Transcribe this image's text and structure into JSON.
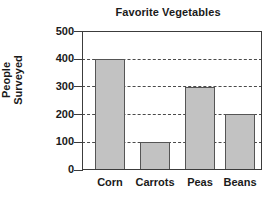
{
  "chart_data": {
    "type": "bar",
    "title": "Favorite Vegetables",
    "xlabel": "",
    "ylabel": "People Surveyed",
    "ylabel_lines": [
      "People",
      "Surveyed"
    ],
    "categories": [
      "Corn",
      "Carrots",
      "Peas",
      "Beans"
    ],
    "values": [
      400,
      100,
      300,
      200
    ],
    "ylim": [
      0,
      500
    ],
    "ytick_labels": [
      "500",
      "400",
      "300",
      "200",
      "100",
      "0"
    ],
    "ytick_values": [
      500,
      400,
      300,
      200,
      100,
      0
    ],
    "gridlines_at": [
      400,
      300,
      200,
      100
    ],
    "grid": true,
    "grid_style": "dashed",
    "legend": false,
    "bar_fill_color": "#c2c2c2",
    "bar_edge_color": "#555555",
    "axis_color": "#3c3c3c",
    "text_color": "#1a1a1a",
    "background_color": "#ffffff"
  }
}
